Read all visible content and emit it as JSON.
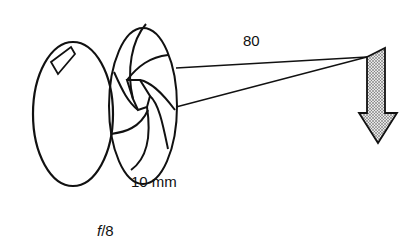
{
  "diagram": {
    "labels": {
      "distance": "80",
      "aperture_diameter": "10 mm",
      "f_number_prefix": "f",
      "f_number_suffix": "/8"
    },
    "elements": [
      "lens",
      "iris-diaphragm",
      "light-rays",
      "subject-arrow"
    ],
    "colors": {
      "stroke": "#111111",
      "arrow_fill": "#bdbdbd"
    }
  }
}
